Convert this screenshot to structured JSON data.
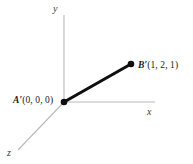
{
  "figure": {
    "background_color": "#ffffff",
    "width": 193,
    "height": 164,
    "axis_color": "#b9b9b9",
    "segment_color": "#100f0f",
    "label_color": "#1a1a1a"
  },
  "axes": {
    "y": {
      "label": "y",
      "from": [
        64,
        102
      ],
      "to": [
        64,
        15
      ]
    },
    "x": {
      "label": "x",
      "from": [
        64,
        102
      ],
      "to": [
        155,
        102
      ]
    },
    "z": {
      "label": "z",
      "from": [
        64,
        102
      ],
      "to": [
        18,
        150
      ]
    }
  },
  "points": [
    {
      "id": "A-prime",
      "name": "A′",
      "coords_text": "(0, 0, 0)",
      "full_label": "A′(0, 0, 0)",
      "values": [
        0,
        0,
        0
      ],
      "pixel": [
        64,
        102
      ]
    },
    {
      "id": "B-prime",
      "name": "B′",
      "coords_text": "(1, 2, 1)",
      "full_label": "B′(1, 2, 1)",
      "values": [
        1,
        2,
        1
      ],
      "pixel": [
        131,
        64
      ]
    }
  ],
  "segment": {
    "id": "segment-a-prime-b-prime",
    "from_pixel": [
      64,
      102
    ],
    "to_pixel": [
      131,
      64
    ],
    "stroke_width": 3.1
  }
}
